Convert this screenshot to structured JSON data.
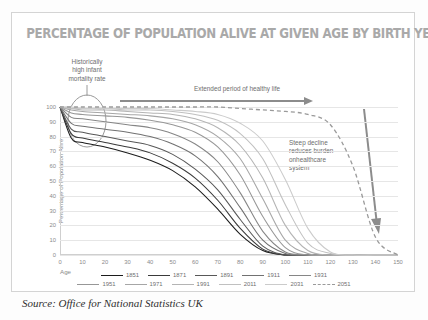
{
  "chart_data": {
    "type": "line",
    "title": "PERCENTAGE OF POPULATION ALIVE AT GIVEN AGE BY BIRTH YEAR",
    "xlabel": "Age",
    "ylabel": "Percentage of Population Alive",
    "xlim": [
      0,
      150
    ],
    "ylim": [
      0,
      100
    ],
    "grid": true,
    "legend_position": "bottom",
    "xticks": [
      0,
      10,
      20,
      30,
      40,
      50,
      60,
      70,
      80,
      90,
      100,
      110,
      120,
      130,
      140,
      150
    ],
    "yticks": [
      0,
      10,
      20,
      30,
      40,
      50,
      60,
      70,
      80,
      90,
      100
    ],
    "x": [
      0,
      5,
      10,
      20,
      30,
      40,
      50,
      60,
      70,
      80,
      90,
      100,
      110,
      120,
      130,
      140,
      150
    ],
    "series": [
      {
        "name": "1851",
        "color": "#1c1c1c",
        "dash": false,
        "values": [
          100,
          79,
          76,
          73,
          69,
          64,
          57,
          46,
          31,
          14,
          3,
          0,
          0,
          0,
          0,
          0,
          0
        ]
      },
      {
        "name": "1871",
        "color": "#3a3a3a",
        "dash": false,
        "values": [
          100,
          82,
          79,
          76,
          73,
          69,
          62,
          52,
          37,
          18,
          4,
          0,
          0,
          0,
          0,
          0,
          0
        ]
      },
      {
        "name": "1891",
        "color": "#585858",
        "dash": false,
        "values": [
          100,
          85,
          83,
          80,
          77,
          74,
          68,
          58,
          44,
          24,
          6,
          0,
          0,
          0,
          0,
          0,
          0
        ]
      },
      {
        "name": "1911",
        "color": "#717171",
        "dash": false,
        "values": [
          100,
          89,
          87,
          85,
          83,
          80,
          75,
          67,
          53,
          32,
          10,
          1,
          0,
          0,
          0,
          0,
          0
        ]
      },
      {
        "name": "1931",
        "color": "#868686",
        "dash": false,
        "values": [
          100,
          93,
          92,
          90,
          88,
          86,
          82,
          75,
          63,
          42,
          16,
          2,
          0,
          0,
          0,
          0,
          0
        ]
      },
      {
        "name": "1951",
        "color": "#979797",
        "dash": false,
        "values": [
          100,
          96,
          95,
          94,
          93,
          91,
          88,
          83,
          73,
          54,
          26,
          5,
          0,
          0,
          0,
          0,
          0
        ]
      },
      {
        "name": "1971",
        "color": "#a6a6a6",
        "dash": false,
        "values": [
          100,
          98,
          97,
          96,
          95,
          94,
          92,
          88,
          80,
          65,
          38,
          10,
          1,
          0,
          0,
          0,
          0
        ]
      },
      {
        "name": "1991",
        "color": "#b4b4b4",
        "dash": false,
        "values": [
          100,
          99,
          98,
          98,
          97,
          96,
          95,
          92,
          86,
          74,
          52,
          20,
          3,
          0,
          0,
          0,
          0
        ]
      },
      {
        "name": "2011",
        "color": "#c0c0c0",
        "dash": false,
        "values": [
          100,
          99,
          99,
          99,
          98,
          98,
          97,
          95,
          91,
          82,
          65,
          34,
          8,
          1,
          0,
          0,
          0
        ]
      },
      {
        "name": "2031",
        "color": "#cbcbcb",
        "dash": false,
        "values": [
          100,
          100,
          99,
          99,
          99,
          99,
          98,
          97,
          95,
          89,
          77,
          51,
          18,
          2,
          0,
          0,
          0
        ]
      },
      {
        "name": "2051",
        "color": "#9a9a9a",
        "dash": true,
        "values": [
          100,
          100,
          100,
          100,
          100,
          100,
          100,
          100,
          100,
          99,
          98,
          97,
          95,
          88,
          60,
          12,
          0
        ]
      }
    ],
    "annotations": [
      {
        "name": "infant-mortality",
        "lines": [
          "Historically",
          "high infant",
          "mortality rate"
        ],
        "marker": "ellipse-callout"
      },
      {
        "name": "healthy-life",
        "lines": [
          "Extended period of healthy life"
        ],
        "marker": "right-arrow"
      },
      {
        "name": "steep-decline",
        "lines": [
          "Steep decline",
          "reduces burden",
          "onhealthcare",
          "system"
        ],
        "marker": "down-arrow"
      }
    ]
  },
  "source": "Source: Office for National Statistics UK",
  "colors": {
    "border": "#d4d4d4",
    "title": "#a9a9a9",
    "grid": "#e6e6e6",
    "annotation": "#6e6e6e",
    "arrow": "#8c8c8c",
    "tick": "#8a8a8a"
  }
}
